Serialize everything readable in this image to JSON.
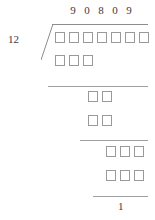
{
  "problem": {
    "divisor": "12",
    "quotient_digits": [
      "9",
      "0",
      "8",
      "0",
      "9"
    ],
    "remainder": "1"
  },
  "rows": [
    {
      "name": "dividend-row",
      "boxes": 7
    },
    {
      "name": "subtract-row-1",
      "boxes": 3
    },
    {
      "name": "bringdown-row-1",
      "boxes": 2
    },
    {
      "name": "subtract-row-2",
      "boxes": 2
    },
    {
      "name": "bringdown-row-2",
      "boxes": 3
    },
    {
      "name": "subtract-row-3",
      "boxes": 3
    }
  ],
  "colors": {
    "box_border": "#9a9a9a",
    "rule": "#a0a0a0",
    "text": "#3c3c3c",
    "background": "#ffffff"
  }
}
